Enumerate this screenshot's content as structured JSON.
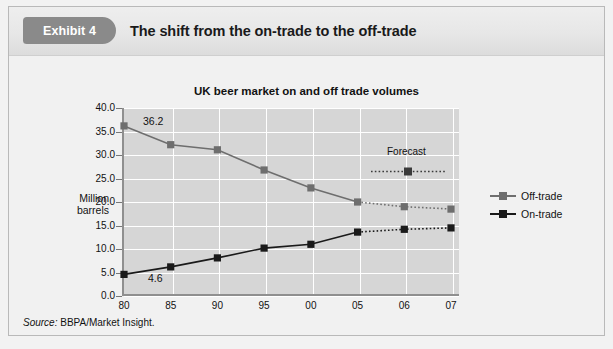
{
  "exhibit": {
    "badge": "Exhibit 4",
    "title": "The shift from the on-trade to the off-trade"
  },
  "source": {
    "prefix": "Source:",
    "text": " BBPA/Market Insight."
  },
  "colors": {
    "badge_bg": "#8a8a8a",
    "plot_bg": "#d6d6d6",
    "grid": "#ffffff",
    "off_trade": "#6e6e6e",
    "on_trade": "#1a1a1a",
    "axis": "#8f8f8f"
  },
  "chart_data": {
    "type": "line",
    "title": "UK beer market on and off trade volumes",
    "xlabel": "",
    "ylabel": "Million barrels",
    "categories": [
      "80",
      "85",
      "90",
      "95",
      "00",
      "05",
      "06",
      "07"
    ],
    "yticks": [
      "0.0",
      "5.0",
      "10.0",
      "15.0",
      "20.0",
      "25.0",
      "30.0",
      "35.0",
      "40.0"
    ],
    "ylim": [
      0.0,
      40.0
    ],
    "grid": true,
    "legend_position": "right",
    "series": [
      {
        "name": "Off-trade",
        "color": "#6e6e6e",
        "values": [
          36.2,
          32.2,
          31.1,
          26.8,
          23.0,
          20.0,
          19.0,
          18.5
        ],
        "forecast_from_index": 5
      },
      {
        "name": "On-trade",
        "color": "#1a1a1a",
        "values": [
          4.6,
          6.2,
          8.1,
          10.2,
          11.0,
          13.6,
          14.2,
          14.5
        ],
        "forecast_from_index": 5
      }
    ],
    "annotations": [
      {
        "label": "36.2",
        "series": "Off-trade",
        "x": "80",
        "value": 36.2
      },
      {
        "label": "4.6",
        "series": "On-trade",
        "x": "80",
        "value": 4.6
      },
      {
        "label": "Forecast",
        "note": "dotted-line callout marking projected years 06-07"
      }
    ]
  }
}
